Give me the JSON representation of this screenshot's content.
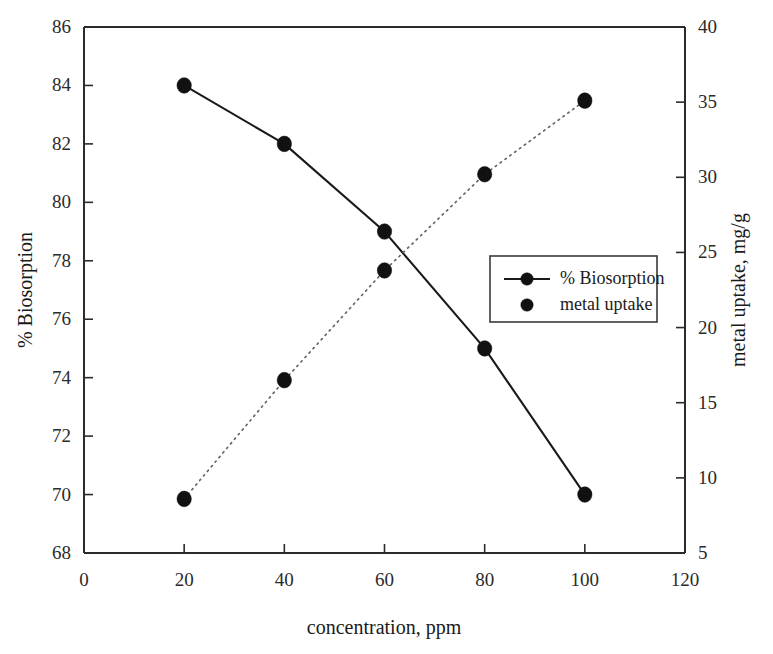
{
  "chart_data": {
    "type": "line",
    "title": "",
    "xlabel": "concentration, ppm",
    "ylabel": "% Biosorption",
    "y2label": "metal uptake, mg/g",
    "x": [
      20,
      40,
      60,
      80,
      100
    ],
    "xlim": [
      0,
      120
    ],
    "ylim": [
      68,
      86
    ],
    "y2lim": [
      5,
      40
    ],
    "xticks": [
      "0",
      "20",
      "40",
      "60",
      "80",
      "100",
      "120"
    ],
    "xtick_values": [
      0,
      20,
      40,
      60,
      80,
      100,
      120
    ],
    "yticks": [
      "68",
      "70",
      "72",
      "74",
      "76",
      "78",
      "80",
      "82",
      "84",
      "86"
    ],
    "ytick_values": [
      68,
      70,
      72,
      74,
      76,
      78,
      80,
      82,
      84,
      86
    ],
    "y2ticks": [
      "5",
      "10",
      "15",
      "20",
      "25",
      "30",
      "35",
      "40"
    ],
    "y2tick_values": [
      5,
      10,
      15,
      20,
      25,
      30,
      35,
      40
    ],
    "grid": false,
    "legend_position": "center-right",
    "series": [
      {
        "name": "% Biosorption",
        "axis": "left",
        "style": "solid-line-with-markers",
        "values": [
          84.0,
          82.0,
          79.0,
          75.0,
          70.0
        ]
      },
      {
        "name": "metal uptake",
        "axis": "right",
        "style": "dotted-line-with-markers",
        "values": [
          8.6,
          16.5,
          23.8,
          30.2,
          35.1
        ]
      }
    ]
  },
  "legend": {
    "entries": [
      {
        "label": "% Biosorption",
        "marker": "filled-circle",
        "line": true
      },
      {
        "label": "metal uptake",
        "marker": "filled-circle",
        "line": false
      }
    ]
  },
  "axes": {
    "x_title": "concentration, ppm",
    "y_left_title": "% Biosorption",
    "y_right_title": "metal uptake, mg/g"
  }
}
